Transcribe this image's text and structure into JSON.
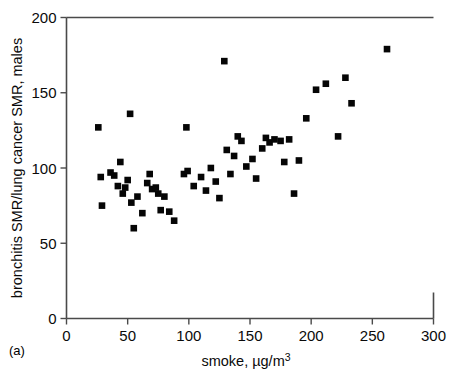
{
  "figure": {
    "panel_label": "(a)",
    "background_color": "#ffffff",
    "marker_color": "#050505",
    "axis_color": "#4a4a4a"
  },
  "chart_data": {
    "type": "scatter",
    "title": "",
    "xlabel": "smoke, µg/m3",
    "xlabel_base": "smoke, µg/m",
    "xlabel_exponent": "3",
    "ylabel": "bronchitis SMR/lung cancer SMR, males",
    "xlim": [
      0,
      300
    ],
    "ylim": [
      0,
      200
    ],
    "xticks": [
      0,
      50,
      100,
      150,
      200,
      250,
      300
    ],
    "xtick_labels": [
      "0",
      "50",
      "100",
      "150",
      "200",
      "250",
      "300"
    ],
    "yticks": [
      0,
      50,
      100,
      150,
      200
    ],
    "ytick_labels": [
      "0",
      "50",
      "100",
      "150",
      "200"
    ],
    "grid": false,
    "legend": null,
    "marker_style": "filled-square",
    "n_points": 56,
    "points": [
      [
        26,
        127
      ],
      [
        28,
        94
      ],
      [
        29,
        75
      ],
      [
        36,
        97
      ],
      [
        39,
        95
      ],
      [
        42,
        88
      ],
      [
        44,
        104
      ],
      [
        46,
        83
      ],
      [
        48,
        87
      ],
      [
        50,
        92
      ],
      [
        52,
        136
      ],
      [
        53,
        77
      ],
      [
        55,
        60
      ],
      [
        58,
        81
      ],
      [
        62,
        70
      ],
      [
        66,
        90
      ],
      [
        68,
        96
      ],
      [
        70,
        86
      ],
      [
        73,
        87
      ],
      [
        75,
        83
      ],
      [
        77,
        72
      ],
      [
        80,
        81
      ],
      [
        84,
        71
      ],
      [
        88,
        65
      ],
      [
        96,
        96
      ],
      [
        98,
        127
      ],
      [
        99,
        98
      ],
      [
        104,
        88
      ],
      [
        110,
        94
      ],
      [
        114,
        85
      ],
      [
        118,
        100
      ],
      [
        122,
        91
      ],
      [
        125,
        80
      ],
      [
        129,
        171
      ],
      [
        131,
        112
      ],
      [
        134,
        96
      ],
      [
        137,
        108
      ],
      [
        140,
        121
      ],
      [
        143,
        118
      ],
      [
        147,
        101
      ],
      [
        152,
        106
      ],
      [
        155,
        93
      ],
      [
        160,
        113
      ],
      [
        163,
        120
      ],
      [
        166,
        117
      ],
      [
        170,
        119
      ],
      [
        175,
        118
      ],
      [
        178,
        104
      ],
      [
        182,
        119
      ],
      [
        186,
        83
      ],
      [
        190,
        105
      ],
      [
        196,
        133
      ],
      [
        204,
        152
      ],
      [
        212,
        156
      ],
      [
        222,
        121
      ],
      [
        228,
        160
      ],
      [
        233,
        143
      ],
      [
        262,
        179
      ]
    ]
  }
}
